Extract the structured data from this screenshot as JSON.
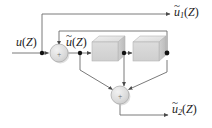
{
  "figure": {
    "type": "block-diagram",
    "title": "",
    "background_color": "#ffffff",
    "line_color": "#5a5a5a",
    "node_color": "#1a1a1a",
    "block_fill_top": "#e6e6e6",
    "block_fill_front": "#d2d2d2",
    "block_fill_side": "#bdbdbd",
    "sum_fill": "#d9d9d9",
    "sum_stroke": "#9a9a9a"
  },
  "labels": {
    "input": {
      "var": "u",
      "tilde": "",
      "sub": "",
      "arg": "(Z)",
      "text": "u(Z)"
    },
    "internal": {
      "var": "u",
      "tilde": "~",
      "sub": "",
      "arg": "(Z)",
      "text": "ũ(Z)"
    },
    "output_1": {
      "var": "u",
      "tilde": "~",
      "sub": "1",
      "arg": "(Z)",
      "text": "ũ1(Z)"
    },
    "output_2": {
      "var": "u",
      "tilde": "~",
      "sub": "2",
      "arg": "(Z)",
      "text": "ũ2(Z)"
    }
  },
  "blocks": [
    {
      "id": "delay-1",
      "label": "",
      "x": 92,
      "y": 36,
      "w": 26,
      "h": 24
    },
    {
      "id": "delay-2",
      "label": "",
      "x": 133,
      "y": 36,
      "w": 26,
      "h": 24
    }
  ],
  "sum_junctions": [
    {
      "id": "sum-top",
      "label": "+",
      "cx": 59,
      "cy": 53,
      "r": 9
    },
    {
      "id": "sum-bottom",
      "label": "+",
      "cx": 120,
      "cy": 95,
      "r": 9
    }
  ],
  "nodes": [
    {
      "id": "node-input-tap",
      "cx": 42,
      "cy": 53
    },
    {
      "id": "node-after-sum",
      "cx": 80,
      "cy": 53
    },
    {
      "id": "node-between-blocks",
      "cx": 124,
      "cy": 53
    },
    {
      "id": "node-right",
      "cx": 167,
      "cy": 53
    }
  ],
  "signals": [
    {
      "id": "input-line",
      "from": "u(Z)",
      "to": "sum-top"
    },
    {
      "id": "outer-feedback",
      "from": "node-right",
      "to": "sum-top"
    },
    {
      "id": "inner-feedback",
      "from": "node-between-blocks",
      "to": "sum-top"
    },
    {
      "id": "output-1-branch",
      "from": "node-input-tap",
      "to": "ũ1(Z)"
    },
    {
      "id": "output-2-branch",
      "from": "sum-bottom",
      "to": "ũ2(Z)"
    },
    {
      "id": "tap-a-to-sum-bottom",
      "from": "node-after-sum",
      "to": "sum-bottom"
    },
    {
      "id": "tap-b-to-sum-bottom",
      "from": "node-between-blocks",
      "to": "sum-bottom"
    },
    {
      "id": "tap-c-to-sum-bottom",
      "from": "node-right",
      "to": "sum-bottom"
    }
  ]
}
